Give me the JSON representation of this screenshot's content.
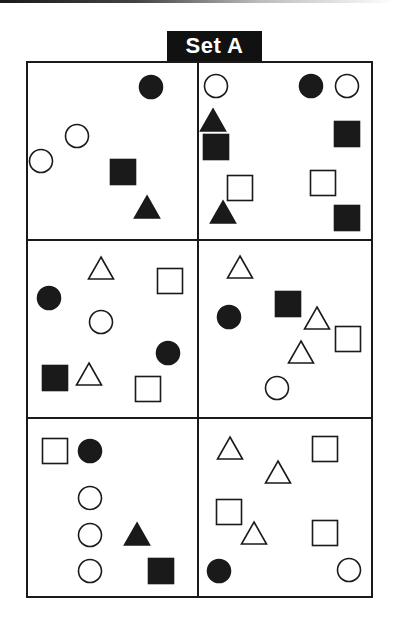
{
  "title": "Set A",
  "colors": {
    "ink": "#1a1a1a",
    "paper": "#ffffff"
  },
  "grid": {
    "left": 27,
    "top": 62,
    "right": 372,
    "bottom": 597,
    "col_divider": 198,
    "row_dividers": [
      240,
      418
    ],
    "rows": 3,
    "cols": 2
  },
  "cells": [
    {
      "id": "r1c1",
      "shapes": [
        {
          "type": "circle",
          "fill": true,
          "x": 151,
          "y": 87
        },
        {
          "type": "circle",
          "fill": false,
          "x": 77,
          "y": 136
        },
        {
          "type": "circle",
          "fill": false,
          "x": 41,
          "y": 161
        },
        {
          "type": "square",
          "fill": true,
          "x": 123,
          "y": 172
        },
        {
          "type": "triangle",
          "fill": true,
          "x": 147,
          "y": 207
        }
      ]
    },
    {
      "id": "r1c2",
      "shapes": [
        {
          "type": "circle",
          "fill": false,
          "x": 216,
          "y": 86
        },
        {
          "type": "circle",
          "fill": true,
          "x": 311,
          "y": 86
        },
        {
          "type": "circle",
          "fill": false,
          "x": 347,
          "y": 86
        },
        {
          "type": "triangle",
          "fill": true,
          "x": 213,
          "y": 120
        },
        {
          "type": "square",
          "fill": true,
          "x": 216,
          "y": 147
        },
        {
          "type": "square",
          "fill": true,
          "x": 347,
          "y": 134
        },
        {
          "type": "square",
          "fill": false,
          "x": 240,
          "y": 188
        },
        {
          "type": "square",
          "fill": false,
          "x": 323,
          "y": 183
        },
        {
          "type": "triangle",
          "fill": true,
          "x": 223,
          "y": 212
        },
        {
          "type": "square",
          "fill": true,
          "x": 347,
          "y": 218
        }
      ]
    },
    {
      "id": "r2c1",
      "shapes": [
        {
          "type": "triangle",
          "fill": false,
          "x": 101,
          "y": 268
        },
        {
          "type": "square",
          "fill": false,
          "x": 170,
          "y": 281
        },
        {
          "type": "circle",
          "fill": true,
          "x": 49,
          "y": 298
        },
        {
          "type": "circle",
          "fill": false,
          "x": 101,
          "y": 322
        },
        {
          "type": "circle",
          "fill": true,
          "x": 168,
          "y": 353
        },
        {
          "type": "square",
          "fill": true,
          "x": 55,
          "y": 378
        },
        {
          "type": "triangle",
          "fill": false,
          "x": 89,
          "y": 374
        },
        {
          "type": "square",
          "fill": false,
          "x": 148,
          "y": 389
        }
      ]
    },
    {
      "id": "r2c2",
      "shapes": [
        {
          "type": "triangle",
          "fill": false,
          "x": 240,
          "y": 267
        },
        {
          "type": "circle",
          "fill": true,
          "x": 229,
          "y": 317
        },
        {
          "type": "square",
          "fill": true,
          "x": 288,
          "y": 304
        },
        {
          "type": "triangle",
          "fill": false,
          "x": 317,
          "y": 318
        },
        {
          "type": "square",
          "fill": false,
          "x": 348,
          "y": 339
        },
        {
          "type": "triangle",
          "fill": false,
          "x": 301,
          "y": 352
        },
        {
          "type": "circle",
          "fill": false,
          "x": 277,
          "y": 388
        }
      ]
    },
    {
      "id": "r3c1",
      "shapes": [
        {
          "type": "square",
          "fill": false,
          "x": 55,
          "y": 451
        },
        {
          "type": "circle",
          "fill": true,
          "x": 90,
          "y": 451
        },
        {
          "type": "circle",
          "fill": false,
          "x": 90,
          "y": 498
        },
        {
          "type": "circle",
          "fill": false,
          "x": 90,
          "y": 535
        },
        {
          "type": "circle",
          "fill": false,
          "x": 90,
          "y": 571
        },
        {
          "type": "triangle",
          "fill": true,
          "x": 137,
          "y": 534
        },
        {
          "type": "square",
          "fill": true,
          "x": 161,
          "y": 571
        }
      ]
    },
    {
      "id": "r3c2",
      "shapes": [
        {
          "type": "triangle",
          "fill": false,
          "x": 230,
          "y": 448
        },
        {
          "type": "square",
          "fill": false,
          "x": 325,
          "y": 449
        },
        {
          "type": "triangle",
          "fill": false,
          "x": 278,
          "y": 472
        },
        {
          "type": "square",
          "fill": false,
          "x": 229,
          "y": 512
        },
        {
          "type": "triangle",
          "fill": false,
          "x": 254,
          "y": 533
        },
        {
          "type": "square",
          "fill": false,
          "x": 325,
          "y": 533
        },
        {
          "type": "circle",
          "fill": true,
          "x": 219,
          "y": 571
        },
        {
          "type": "circle",
          "fill": false,
          "x": 349,
          "y": 570
        }
      ]
    }
  ]
}
